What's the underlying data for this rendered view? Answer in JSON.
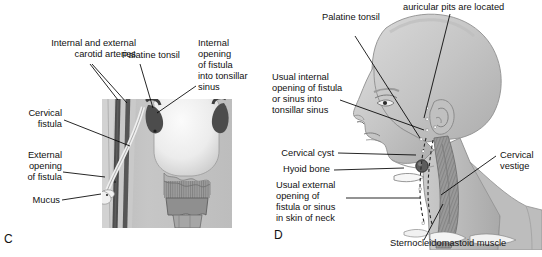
{
  "figure": {
    "domain": "medical-illustration",
    "panels": [
      {
        "id": "C",
        "letter": "C",
        "caption_letter": "C",
        "labels": [
          {
            "name": "internal-external-carotid-arteries",
            "text": "Internal and external\ncarotid arteries",
            "align": "right"
          },
          {
            "name": "palatine-tonsil",
            "text": "Palatine tonsil",
            "align": "left"
          },
          {
            "name": "internal-opening-of-fistula-into-tonsillar-sinus",
            "text": "Internal\nopening\nof fistula\ninto tonsillar\nsinus",
            "align": "left"
          },
          {
            "name": "cervical-fistula",
            "text": "Cervical\nfistula",
            "align": "right"
          },
          {
            "name": "external-opening-of-fistula",
            "text": "External\nopening\nof fistula",
            "align": "right"
          },
          {
            "name": "mucus",
            "text": "Mucus",
            "align": "right"
          }
        ]
      },
      {
        "id": "D",
        "letter": "D",
        "caption_letter": "D",
        "labels": [
          {
            "name": "auricular-pits-are-located",
            "text": "auricular pits are located",
            "align": "left",
            "clipped_line_above": true
          },
          {
            "name": "palatine-tonsil",
            "text": "Palatine tonsil",
            "align": "left"
          },
          {
            "name": "usual-internal-opening-of-fistula-or-sinus-into-tonsillar-sinus",
            "text": "Usual internal\nopening of fistula\nor sinus into\ntonsillar sinus",
            "align": "left"
          },
          {
            "name": "cervical-cyst",
            "text": "Cervical cyst",
            "align": "right"
          },
          {
            "name": "hyoid-bone",
            "text": "Hyoid bone",
            "align": "right"
          },
          {
            "name": "usual-external-opening-of-fistula-or-sinus-in-skin-of-neck",
            "text": "Usual external\nopening of\nfistula or sinus\nin skin of neck",
            "align": "left"
          },
          {
            "name": "cervical-vestige",
            "text": "Cervical\nvestige",
            "align": "left"
          },
          {
            "name": "sternocleidomastoid-muscle",
            "text": "Sternocleidomastoid muscle",
            "align": "left"
          }
        ]
      }
    ]
  },
  "colors": {
    "background": "#ffffff",
    "ink": "#111111",
    "tissue_light": "#cfcfcf",
    "tissue_mid": "#b4b4b4",
    "tissue_dark": "#8e8e8e",
    "vessel_dark": "#4a4a4a",
    "tonsil_dark": "#4f4f4f",
    "highlight_white": "#f4f4f4",
    "muscle": "#9a9a9a"
  }
}
